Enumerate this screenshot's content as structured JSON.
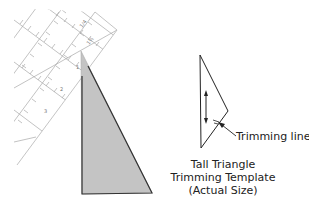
{
  "figure": {
    "ruler": {
      "label": "quilting ruler",
      "color": "#9a9a9a"
    },
    "large_triangle": {
      "label": "tall triangle patch",
      "fill": "#c4c4c4",
      "stroke": "#333333"
    },
    "template": {
      "label": "trimming template",
      "annotation": "Trimming line",
      "caption": [
        "Tall Triangle",
        "Trimming Template",
        "(Actual Size)"
      ]
    }
  }
}
